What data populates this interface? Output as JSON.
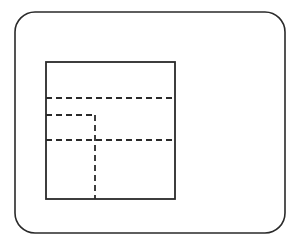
{
  "diagram": {
    "type": "layout-schematic",
    "colors": {
      "background": "#ffffff",
      "stroke": "#2a2a2a"
    },
    "outer_frame": {
      "x": 15,
      "y": 12,
      "width": 270,
      "height": 221,
      "corner_radius": 20
    },
    "inner_square": {
      "x": 46,
      "y": 62,
      "width": 129,
      "height": 137
    },
    "dashed_lines": [
      {
        "id": "h-top",
        "x1": 46,
        "y1": 98,
        "x2": 175,
        "y2": 98
      },
      {
        "id": "l-shape-horizontal",
        "x1": 46,
        "y1": 115,
        "x2": 95,
        "y2": 115
      },
      {
        "id": "l-shape-vertical",
        "x1": 95,
        "y1": 115,
        "x2": 95,
        "y2": 199
      },
      {
        "id": "h-middle",
        "x1": 46,
        "y1": 140,
        "x2": 175,
        "y2": 140
      }
    ]
  }
}
